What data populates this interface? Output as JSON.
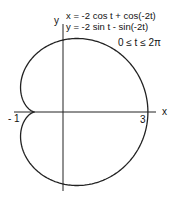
{
  "chart_data": {
    "type": "line",
    "title": "",
    "equations": [
      "x = -2 cos t + cos(-2t)",
      "y = -2 sin t - sin(-2t)"
    ],
    "parameter_range": "0 ≤ t ≤ 2π",
    "xlabel": "x",
    "ylabel": "y",
    "x_ticks": [
      {
        "value": -1,
        "label": "- 1"
      },
      {
        "value": 3,
        "label": "3"
      }
    ],
    "xlim": [
      -1.5,
      3
    ],
    "ylim": [
      -2.6,
      2.6
    ],
    "grid": false,
    "series": [
      {
        "name": "cardioid",
        "t_range": [
          0,
          6.2832
        ]
      }
    ]
  },
  "labels": {
    "eq1": "x = -2 cos t + cos(-2t)",
    "eq2": "y = -2 sin t - sin(-2t)",
    "range": "0 ≤ t ≤ 2π",
    "x_axis": "x",
    "y_axis": "y",
    "tick_neg1": "- 1",
    "tick_3": "3"
  }
}
